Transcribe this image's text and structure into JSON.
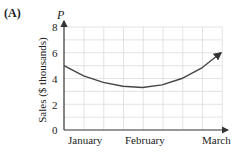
{
  "panel_label": "(A)",
  "chart_data": {
    "type": "line",
    "title": "",
    "xlabel": "",
    "ylabel": "Sales ($ thousands)",
    "y_axis_symbol": "P",
    "categories": [
      "January",
      "February",
      "March"
    ],
    "yticks": [
      "0",
      "2",
      "4",
      "6",
      "8"
    ],
    "ylim": [
      0,
      8
    ],
    "grid": true,
    "series": [
      {
        "name": "P",
        "x": [
          0,
          0.25,
          0.5,
          0.75,
          1.0,
          1.25,
          1.5,
          1.75,
          2.0
        ],
        "values": [
          5.0,
          4.2,
          3.7,
          3.4,
          3.3,
          3.5,
          4.0,
          4.8,
          6.0
        ]
      }
    ],
    "arrow_at_end": true
  }
}
